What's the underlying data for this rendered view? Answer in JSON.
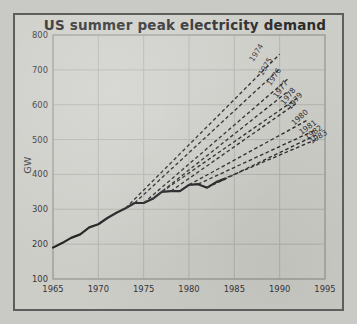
{
  "figure": {
    "background_color": "#cdcdc8",
    "border_color": "#5e5e5c"
  },
  "chart_data": {
    "type": "line",
    "title": "US summer peak electricity demand",
    "xlabel": "",
    "ylabel": "GW",
    "xlim": [
      1965,
      1995
    ],
    "ylim": [
      100,
      800
    ],
    "xticks": [
      1965,
      1970,
      1975,
      1980,
      1985,
      1990,
      1995
    ],
    "xtick_labels": [
      "1965",
      "1970",
      "1975",
      "1980",
      "1985",
      "1990",
      "1995"
    ],
    "yticks": [
      100,
      200,
      300,
      400,
      500,
      600,
      700,
      800
    ],
    "ytick_labels": [
      "100",
      "200",
      "300",
      "400",
      "500",
      "600",
      "700",
      "800"
    ],
    "grid": true,
    "legend_position": "inline-line-end-labels",
    "series": [
      {
        "name": "Actual demand",
        "style": "solid",
        "color": "#1d1d1f",
        "x": [
          1965,
          1966,
          1967,
          1968,
          1969,
          1970,
          1971,
          1972,
          1973,
          1974,
          1975,
          1976,
          1977,
          1978,
          1979,
          1980,
          1981,
          1982,
          1983,
          1984
        ],
        "values": [
          190,
          203,
          218,
          228,
          248,
          257,
          275,
          290,
          303,
          318,
          318,
          330,
          350,
          352,
          352,
          370,
          372,
          362,
          378,
          388
        ]
      },
      {
        "name": "1974",
        "style": "dashed",
        "color": "#2a2a2d",
        "x": [
          1973,
          1990
        ],
        "values": [
          303,
          745
        ]
      },
      {
        "name": "1975",
        "style": "dashed",
        "color": "#2a2a2d",
        "x": [
          1974,
          1990
        ],
        "values": [
          318,
          703
        ]
      },
      {
        "name": "1976",
        "style": "dashed",
        "color": "#2a2a2d",
        "x": [
          1975,
          1991
        ],
        "values": [
          318,
          676
        ]
      },
      {
        "name": "1977",
        "style": "dashed",
        "color": "#2a2a2d",
        "x": [
          1976,
          1991
        ],
        "values": [
          330,
          640
        ]
      },
      {
        "name": "1978",
        "style": "dashed",
        "color": "#2a2a2d",
        "x": [
          1977,
          1992
        ],
        "values": [
          350,
          620
        ]
      },
      {
        "name": "1979",
        "style": "dashed",
        "color": "#2a2a2d",
        "x": [
          1978,
          1992
        ],
        "values": [
          352,
          607
        ]
      },
      {
        "name": "1980",
        "style": "dashed",
        "color": "#2a2a2d",
        "x": [
          1980,
          1993
        ],
        "values": [
          370,
          555
        ]
      },
      {
        "name": "1981",
        "style": "dashed",
        "color": "#2a2a2d",
        "x": [
          1981,
          1994
        ],
        "values": [
          372,
          528
        ]
      },
      {
        "name": "1982",
        "style": "dashed",
        "color": "#2a2a2d",
        "x": [
          1982,
          1994
        ],
        "values": [
          362,
          513
        ]
      },
      {
        "name": "1983",
        "style": "dashed",
        "color": "#2a2a2d",
        "x": [
          1983,
          1994
        ],
        "values": [
          378,
          500
        ]
      }
    ],
    "annotations": [
      {
        "text": "1974",
        "x": 1987.1,
        "y": 722,
        "rotation": -58
      },
      {
        "text": "1975",
        "x": 1988.1,
        "y": 682,
        "rotation": -58
      },
      {
        "text": "1976",
        "x": 1989.0,
        "y": 653,
        "rotation": -56
      },
      {
        "text": "1977",
        "x": 1989.7,
        "y": 618,
        "rotation": -54
      },
      {
        "text": "1978",
        "x": 1990.5,
        "y": 598,
        "rotation": -52
      },
      {
        "text": "1979",
        "x": 1991.2,
        "y": 585,
        "rotation": -50
      },
      {
        "text": "1980",
        "x": 1991.6,
        "y": 540,
        "rotation": -42
      },
      {
        "text": "1981",
        "x": 1992.4,
        "y": 513,
        "rotation": -36
      },
      {
        "text": "1982",
        "x": 1993.0,
        "y": 499,
        "rotation": -34
      },
      {
        "text": "1983",
        "x": 1993.5,
        "y": 487,
        "rotation": -32
      }
    ]
  }
}
